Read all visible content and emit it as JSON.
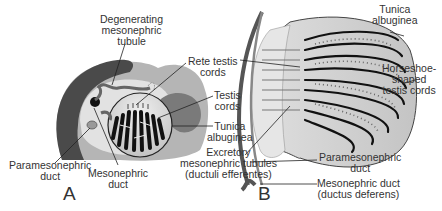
{
  "figure": {
    "panels": [
      {
        "id": "A",
        "label": "A",
        "labels": {
          "degenerating_tubule": [
            "Degenerating",
            "mesonephric",
            "tubule"
          ],
          "rete_testis": [
            "Rete testis",
            "cords"
          ],
          "testis_cords": [
            "Testis",
            "cords"
          ],
          "tunica_albuginea": [
            "Tunica",
            "albuginea"
          ],
          "paramesonephric_duct": [
            "Paramesonephric",
            "duct"
          ],
          "mesonephric_duct": [
            "Mesonephric",
            "duct"
          ]
        }
      },
      {
        "id": "B",
        "label": "B",
        "labels": {
          "tunica_albuginea": [
            "Tunica",
            "albuginea"
          ],
          "horseshoe_cords": [
            "Horseshoe-",
            "shaped",
            "testis cords"
          ],
          "excretory_tubules": [
            "Excretory",
            "mesonephric tubules",
            "(ductuli efferentes)"
          ],
          "paramesonephric_duct": [
            "Paramesonephric",
            "duct"
          ],
          "mesonephric_duct": [
            "Mesonephric duct",
            "(ductus deferens)"
          ]
        }
      }
    ],
    "colors": {
      "dark_tissue": "#4a4a4a",
      "mid_tissue": "#8a8a8a",
      "light_tissue": "#d4d4d4",
      "cords": "#1a1a1a",
      "leader_line": "#222222"
    }
  }
}
